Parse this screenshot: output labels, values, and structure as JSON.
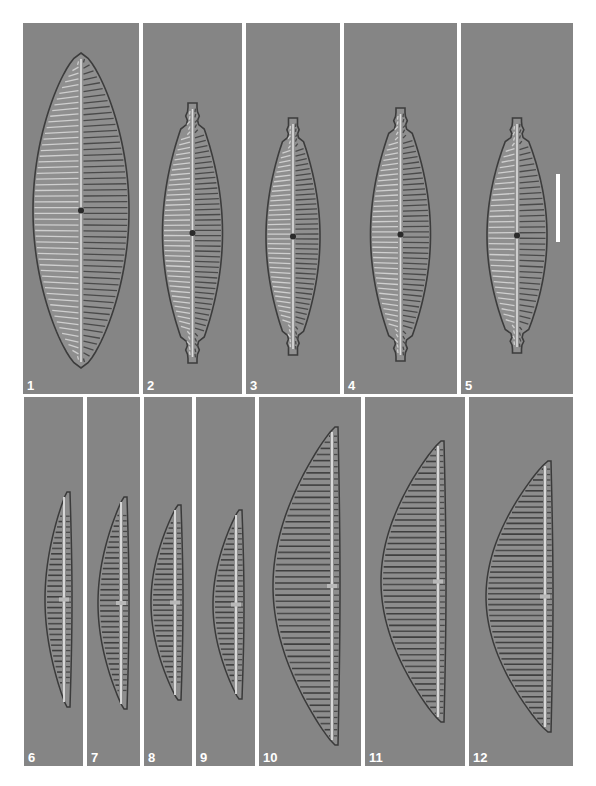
{
  "plate": {
    "background": "#ffffff",
    "panel_background": "#858585",
    "label_color": "#ffffff",
    "rows": [
      {
        "panels": [
          {
            "label": "1",
            "subject": "diatom-valve",
            "shape": "lanceolate-broad",
            "x": 23,
            "y": 23,
            "w": 116,
            "h": 371
          },
          {
            "label": "2",
            "subject": "diatom-valve",
            "shape": "capitate-lanceolate",
            "x": 143,
            "y": 23,
            "w": 99,
            "h": 371
          },
          {
            "label": "3",
            "subject": "diatom-valve",
            "shape": "capitate-lanceolate",
            "x": 246,
            "y": 23,
            "w": 94,
            "h": 371
          },
          {
            "label": "4",
            "subject": "diatom-valve",
            "shape": "capitate-lanceolate",
            "x": 344,
            "y": 23,
            "w": 113,
            "h": 371
          },
          {
            "label": "5",
            "subject": "diatom-valve",
            "shape": "lanceolate-rostrate",
            "x": 461,
            "y": 23,
            "w": 112,
            "h": 371,
            "scale_bar": true
          }
        ]
      },
      {
        "panels": [
          {
            "label": "6",
            "subject": "diatom-valve",
            "shape": "cymbelloid",
            "x": 24,
            "y": 397,
            "w": 59,
            "h": 369
          },
          {
            "label": "7",
            "subject": "diatom-valve",
            "shape": "cymbelloid",
            "x": 87,
            "y": 397,
            "w": 53,
            "h": 369
          },
          {
            "label": "8",
            "subject": "diatom-valve",
            "shape": "cymbelloid",
            "x": 144,
            "y": 397,
            "w": 48,
            "h": 369
          },
          {
            "label": "9",
            "subject": "diatom-valve",
            "shape": "cymbelloid",
            "x": 196,
            "y": 397,
            "w": 59,
            "h": 369
          },
          {
            "label": "10",
            "subject": "diatom-valve",
            "shape": "cymbelloid-large",
            "x": 259,
            "y": 397,
            "w": 102,
            "h": 369
          },
          {
            "label": "11",
            "subject": "diatom-valve",
            "shape": "cymbelloid-large",
            "x": 365,
            "y": 397,
            "w": 100,
            "h": 369
          },
          {
            "label": "12",
            "subject": "diatom-valve",
            "shape": "cymbelloid-large",
            "x": 469,
            "y": 397,
            "w": 104,
            "h": 369
          }
        ]
      }
    ]
  }
}
